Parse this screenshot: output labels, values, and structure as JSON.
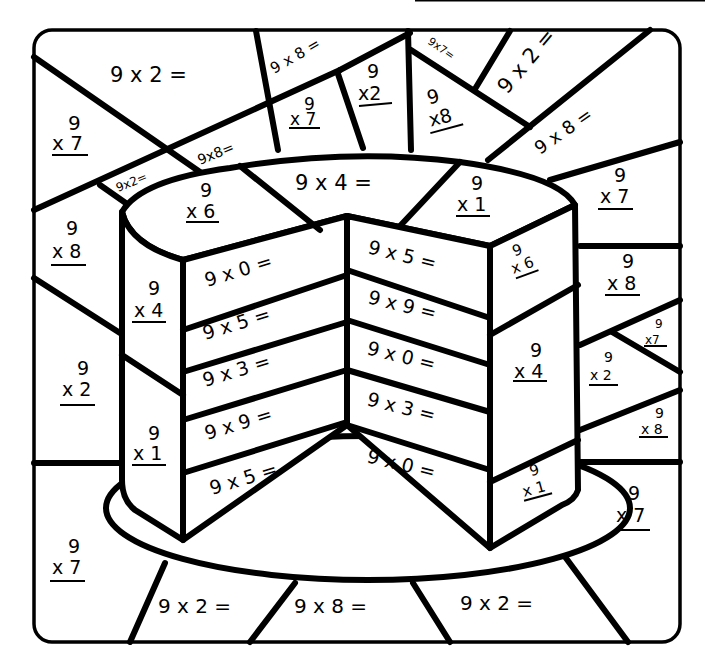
{
  "worksheet": {
    "header_line_visible": true,
    "colors": {
      "ink": "#000000",
      "paper": "#ffffff"
    },
    "regions": {
      "bg_top_left": "9 x 2 =",
      "bg_left_upper": {
        "top": "9",
        "bottom": "x 7"
      },
      "bg_strip_small": "9x2=",
      "bg_strip_mid": "9x8=",
      "bg_top_center": "9 x 8 =",
      "bg_top_center_stacked": {
        "top": "9",
        "bottom": "x 7"
      },
      "bg_top_center2": {
        "top": "9",
        "bottom": "x2"
      },
      "bg_top_right_small": "9x7=",
      "bg_top_right_stacked": {
        "top": "9",
        "bottom": "x8"
      },
      "bg_top_right": "9 x 2 =",
      "bg_right_upper": "9 x 8 =",
      "bg_right_1": {
        "top": "9",
        "bottom": "x 7"
      },
      "bg_right_2": {
        "top": "9",
        "bottom": "x 8"
      },
      "bg_right_3": {
        "top": "9",
        "bottom": "x7"
      },
      "bg_right_4": {
        "top": "9",
        "bottom": "x 2"
      },
      "bg_right_5": {
        "top": "9",
        "bottom": "x 8"
      },
      "bg_right_6": {
        "top": "9",
        "bottom": "x 7"
      },
      "bg_left_2": {
        "top": "9",
        "bottom": "x 8"
      },
      "bg_left_3": {
        "top": "9",
        "bottom": "x 2"
      },
      "bg_left_4": {
        "top": "9",
        "bottom": "x 7"
      },
      "bg_bottom_1": "9 x 2 =",
      "bg_bottom_2": "9 x 8 =",
      "bg_bottom_3": "9 x 2 =",
      "top_left": {
        "top": "9",
        "bottom": "x 6"
      },
      "top_center": "9 x 4 =",
      "top_right": {
        "top": "9",
        "bottom": "x 1"
      },
      "side_left_1": {
        "top": "9",
        "bottom": "x 4"
      },
      "side_left_2": {
        "top": "9",
        "bottom": "x 1"
      },
      "side_right_1": {
        "top": "9",
        "bottom": "x 6"
      },
      "side_right_2": {
        "top": "9",
        "bottom": "x 4"
      },
      "side_right_3": {
        "top": "9",
        "bottom": "x 1"
      },
      "layers_left": [
        "9 x 0 =",
        "9 x 5 =",
        "9 x 3 =",
        "9 x 9 =",
        "9 x 5 ="
      ],
      "layers_right": [
        "9 x 5 =",
        "9 x 9 =",
        "9 x 0 =",
        "9 x 3 =",
        "9 x 0 ="
      ]
    }
  }
}
